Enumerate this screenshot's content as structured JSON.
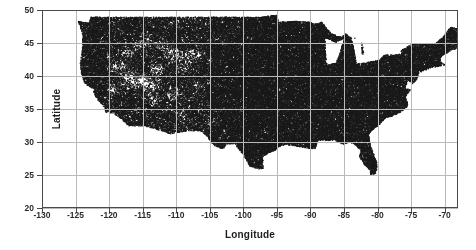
{
  "chart_data": {
    "type": "scatter",
    "title": "",
    "xlabel": "Longitude",
    "ylabel": "Latitude",
    "xlim": [
      -130,
      -68
    ],
    "ylim": [
      20,
      50
    ],
    "xticks": [
      -130,
      -125,
      -120,
      -115,
      -110,
      -105,
      -100,
      -95,
      -90,
      -85,
      -80,
      -75,
      -70
    ],
    "yticks": [
      20,
      25,
      30,
      35,
      40,
      45,
      50
    ],
    "xtick_labels": [
      "-130",
      "-125",
      "-120",
      "-115",
      "-110",
      "-105",
      "-100",
      "-95",
      "-90",
      "-85",
      "-80",
      "-75",
      "-70"
    ],
    "ytick_labels": [
      "20",
      "25",
      "30",
      "35",
      "40",
      "45",
      "50"
    ],
    "grid": true,
    "legend": null,
    "marker_color": "#1a1a1a",
    "marker_size": 1,
    "point_count_approx": 60000,
    "data_extent": {
      "longitude_min": -124.7,
      "longitude_max": -66.9,
      "latitude_min": 24.5,
      "latitude_max": 49.4
    },
    "density_regions": [
      {
        "name": "eastern-us",
        "lon_range": [
          -100,
          -67
        ],
        "lat_range": [
          25,
          47
        ],
        "density": "saturated"
      },
      {
        "name": "great-plains",
        "lon_range": [
          -105,
          -100
        ],
        "lat_range": [
          26,
          49
        ],
        "density": "high"
      },
      {
        "name": "interior-west",
        "lon_range": [
          -120,
          -105
        ],
        "lat_range": [
          33,
          49
        ],
        "density": "patchy"
      },
      {
        "name": "pacific-coast",
        "lon_range": [
          -125,
          -120
        ],
        "lat_range": [
          32,
          49
        ],
        "density": "high"
      }
    ],
    "voids": [
      {
        "name": "lake-michigan",
        "lon_range": [
          -88,
          -85
        ],
        "lat_range": [
          42,
          46
        ]
      },
      {
        "name": "great-basin",
        "lon_range": [
          -119,
          -113
        ],
        "lat_range": [
          37.5,
          42
        ]
      },
      {
        "name": "wyoming-basin",
        "lon_range": [
          -111,
          -107
        ],
        "lat_range": [
          42,
          45
        ]
      }
    ]
  }
}
